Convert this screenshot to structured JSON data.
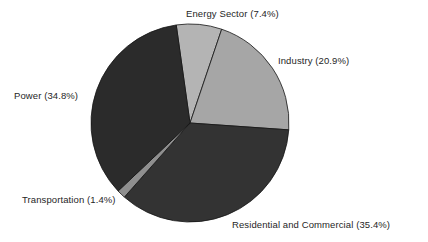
{
  "figure": {
    "background_color": "#ffffff",
    "text_color": "#262626"
  },
  "chart_data": {
    "type": "pie",
    "title": "",
    "xlabel": "",
    "ylabel": "",
    "legend_position": "none",
    "grid": false,
    "label_format": "{name} ({value}%)",
    "start_angle_deg": -8,
    "direction": "clockwise",
    "center": {
      "x": 190,
      "y": 123
    },
    "radius": 99,
    "categories": [
      "Energy Sector",
      "Industry",
      "Residential and Commercial",
      "Transportation",
      "Power"
    ],
    "values": [
      7.4,
      20.9,
      35.4,
      1.4,
      34.8
    ],
    "colors": [
      "#b4b4b4",
      "#a6a6a6",
      "#333333",
      "#8f8f8f",
      "#2b2b2b"
    ],
    "slices": [
      {
        "name": "Energy Sector",
        "value": 7.4,
        "label": "Energy Sector (7.4%)",
        "color": "#b4b4b4",
        "sweep_deg": 26.6
      },
      {
        "name": "Industry",
        "value": 20.9,
        "label": "Industry (20.9%)",
        "color": "#a6a6a6",
        "sweep_deg": 75.2
      },
      {
        "name": "Residential and Commercial",
        "value": 35.4,
        "label": "Residential and Commercial (35.4%)",
        "color": "#333333",
        "sweep_deg": 127.4
      },
      {
        "name": "Transportation",
        "value": 1.4,
        "label": "Transportation (1.4%)",
        "color": "#8f8f8f",
        "sweep_deg": 5.0
      },
      {
        "name": "Power",
        "value": 34.8,
        "label": "Power (34.8%)",
        "color": "#2b2b2b",
        "sweep_deg": 125.3
      }
    ]
  }
}
